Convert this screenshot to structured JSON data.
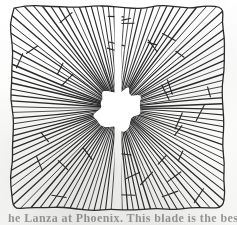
{
  "document": {
    "kind": "scanned-figure",
    "title": "Radial burst pattern in square frame",
    "background_color": "#fdfdfc",
    "ink_color": "#2b2b2b"
  },
  "figure": {
    "label": "radial-burst-figure",
    "frame": {
      "shape": "square",
      "left": 12,
      "top": 7,
      "width": 212,
      "height": 202,
      "hand_drawn": true,
      "stroke_color": "#2b2b2b"
    },
    "center": {
      "x": 118,
      "y": 108
    },
    "core": {
      "shape": "irregular-blob",
      "fill": "#ffffff",
      "radius_x": 22,
      "radius_y": 20
    },
    "split": {
      "orientation": "vertical",
      "x": 118,
      "gap_width": 7,
      "description": "vertical gap dividing the burst into left and right halves"
    },
    "rays": {
      "count": 116,
      "stroke_color": "#2b2b2b",
      "stroke_width": 1.05,
      "description": "straight lines radiating from the central blob out to the square frame"
    },
    "ticks": {
      "count": 34,
      "shape": "short-cross-stroke",
      "stroke_color": "#2b2b2b",
      "description": "small cross hatch marks crossing the rays at varied radii"
    }
  },
  "caption": {
    "text": "he Lanza at Phoenix. This blade is the best",
    "clipped": true,
    "position": "bottom"
  }
}
